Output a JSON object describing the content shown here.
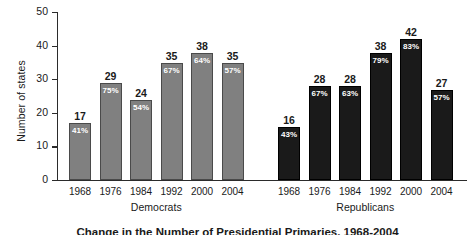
{
  "chart_data": {
    "type": "bar",
    "title": "Change in the Number of Presidential Primaries, 1968-2004",
    "xlabel": "",
    "ylabel": "Number of states",
    "ylim": [
      0,
      50
    ],
    "yticks": [
      0,
      10,
      20,
      30,
      40,
      50
    ],
    "grid": false,
    "legend_position": "none",
    "categories": [
      "1968",
      "1976",
      "1984",
      "1992",
      "2000",
      "2004",
      "1968",
      "1976",
      "1984",
      "1992",
      "2000",
      "2004"
    ],
    "values": [
      17,
      29,
      24,
      35,
      38,
      35,
      16,
      28,
      28,
      38,
      42,
      27
    ],
    "groups": [
      {
        "name": "Democrats",
        "color": "#808080",
        "points": [
          {
            "x": "1968",
            "value": 17,
            "pct": "41%"
          },
          {
            "x": "1976",
            "value": 29,
            "pct": "75%"
          },
          {
            "x": "1984",
            "value": 24,
            "pct": "54%"
          },
          {
            "x": "1992",
            "value": 35,
            "pct": "67%"
          },
          {
            "x": "2000",
            "value": 38,
            "pct": "64%"
          },
          {
            "x": "2004",
            "value": 35,
            "pct": "57%"
          }
        ]
      },
      {
        "name": "Republicans",
        "color": "#1a1a1a",
        "points": [
          {
            "x": "1968",
            "value": 16,
            "pct": "43%"
          },
          {
            "x": "1976",
            "value": 28,
            "pct": "67%"
          },
          {
            "x": "1984",
            "value": 28,
            "pct": "63%"
          },
          {
            "x": "1992",
            "value": 38,
            "pct": "79%"
          },
          {
            "x": "2000",
            "value": 42,
            "pct": "83%"
          },
          {
            "x": "2004",
            "value": 27,
            "pct": "57%"
          }
        ]
      }
    ]
  },
  "axis": {
    "y_title": "Number of states",
    "y_ticks": [
      "0",
      "10",
      "20",
      "30",
      "40",
      "50"
    ]
  },
  "caption": {
    "text": "Change in the Number of Presidential Primaries, 1968-2004"
  },
  "colors": {
    "democrat_bar": "#808080",
    "republican_bar": "#1a1a1a",
    "axis": "#2b2b2b",
    "value_label": "#1a1a1a",
    "pct_label": "#ffffff",
    "background": "#ffffff"
  }
}
